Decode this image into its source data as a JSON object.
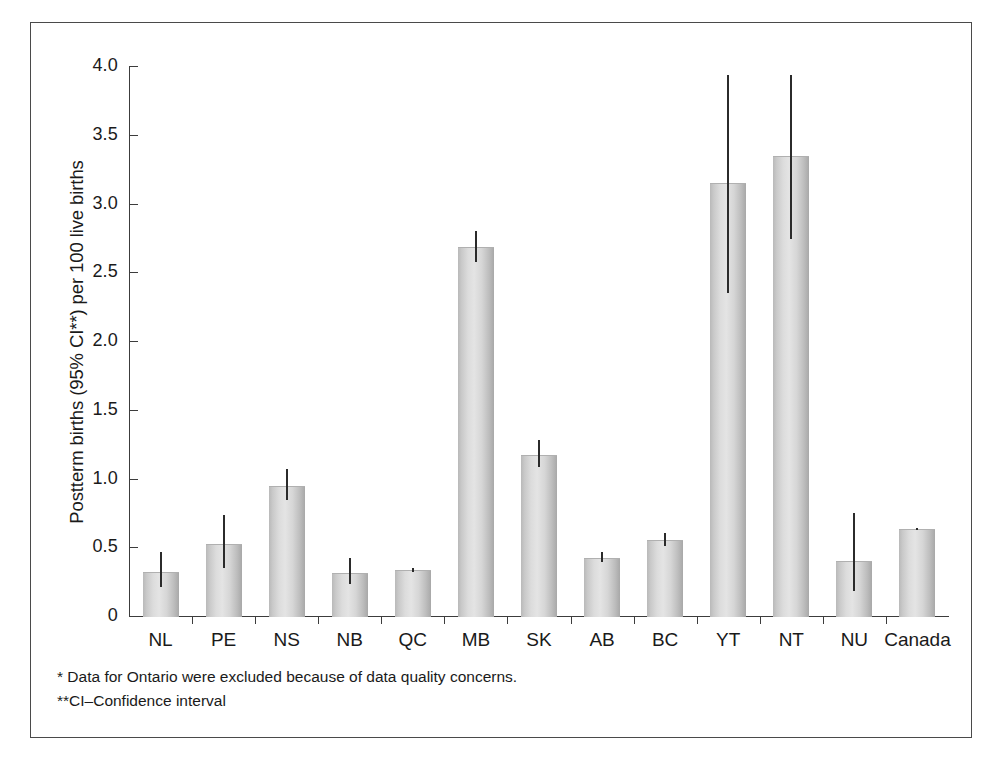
{
  "chart_data": {
    "type": "bar",
    "title": "",
    "xlabel": "",
    "ylabel": "Postterm births (95% CI**) per 100 live births",
    "ylim": [
      0,
      4.0
    ],
    "ytick_labels": [
      "4.0",
      "3.5",
      "3.0",
      "2.5",
      "2.0",
      "1.5",
      "1.0",
      "0.5",
      "0"
    ],
    "ytick_values": [
      4.0,
      3.5,
      3.0,
      2.5,
      2.0,
      1.5,
      1.0,
      0.5,
      0
    ],
    "grid": false,
    "legend": "none",
    "error_bars": "95% confidence interval",
    "categories": [
      "NL",
      "PE",
      "NS",
      "NB",
      "QC",
      "MB",
      "SK",
      "AB",
      "BC",
      "YT",
      "NT",
      "NU",
      "Canada"
    ],
    "values": [
      0.33,
      0.53,
      0.95,
      0.32,
      0.34,
      2.69,
      1.18,
      0.43,
      0.56,
      3.16,
      3.35,
      0.41,
      0.64
    ],
    "ci_low": [
      0.22,
      0.36,
      0.85,
      0.24,
      0.33,
      2.58,
      1.09,
      0.4,
      0.52,
      2.36,
      2.75,
      0.19,
      0.63
    ],
    "ci_high": [
      0.47,
      0.74,
      1.08,
      0.43,
      0.36,
      2.81,
      1.29,
      0.47,
      0.61,
      3.94,
      3.94,
      0.76,
      0.65
    ],
    "points": [
      {
        "category": "NL",
        "value": 0.33,
        "ci_low": 0.22,
        "ci_high": 0.47
      },
      {
        "category": "PE",
        "value": 0.53,
        "ci_low": 0.36,
        "ci_high": 0.74
      },
      {
        "category": "NS",
        "value": 0.95,
        "ci_low": 0.85,
        "ci_high": 1.08
      },
      {
        "category": "NB",
        "value": 0.32,
        "ci_low": 0.24,
        "ci_high": 0.43
      },
      {
        "category": "QC",
        "value": 0.34,
        "ci_low": 0.33,
        "ci_high": 0.36
      },
      {
        "category": "MB",
        "value": 2.69,
        "ci_low": 2.58,
        "ci_high": 2.81
      },
      {
        "category": "SK",
        "value": 1.18,
        "ci_low": 1.09,
        "ci_high": 1.29
      },
      {
        "category": "AB",
        "value": 0.43,
        "ci_low": 0.4,
        "ci_high": 0.47
      },
      {
        "category": "BC",
        "value": 0.56,
        "ci_low": 0.52,
        "ci_high": 0.61
      },
      {
        "category": "YT",
        "value": 3.16,
        "ci_low": 2.36,
        "ci_high": 3.94
      },
      {
        "category": "NT",
        "value": 3.35,
        "ci_low": 2.75,
        "ci_high": 3.94
      },
      {
        "category": "NU",
        "value": 0.41,
        "ci_low": 0.19,
        "ci_high": 0.76
      },
      {
        "category": "Canada",
        "value": 0.64,
        "ci_low": 0.63,
        "ci_high": 0.65
      }
    ],
    "colors": {
      "bar_fill": "#dcdcdc",
      "bar_edge": "#b0b0b0",
      "error_bar": "#2b2b2b",
      "axis": "#3c3c3c",
      "text": "#1a1a1a",
      "frame": "#4a4a4a",
      "background": "#ffffff"
    }
  },
  "footnotes": [
    "* Data for Ontario were excluded because of data quality concerns.",
    "**CI–Confidence interval"
  ]
}
